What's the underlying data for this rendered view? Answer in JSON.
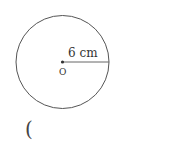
{
  "figure": {
    "shape": "circle",
    "center_label": "O",
    "radius_label": "6 cm",
    "radius_value": 6,
    "radius_unit": "cm"
  },
  "answer": {
    "open_paren": "("
  },
  "colors": {
    "stroke": "#555555",
    "text": "#333333"
  }
}
